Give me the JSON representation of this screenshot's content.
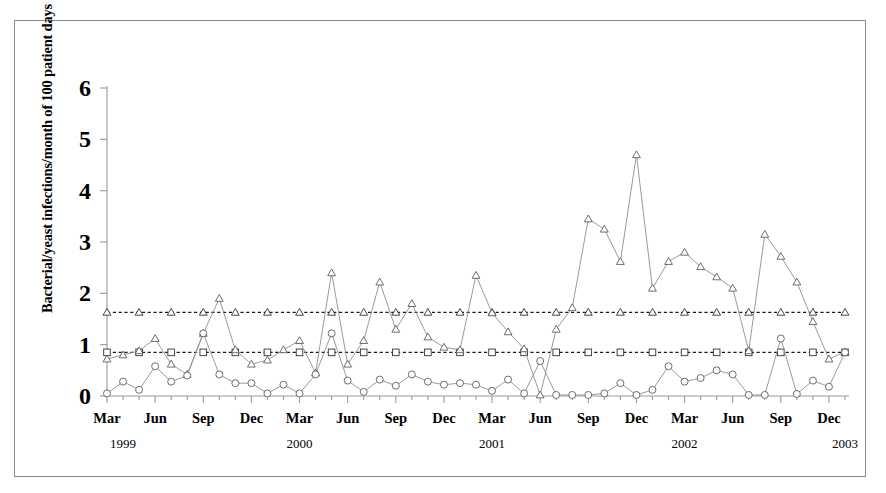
{
  "figure": {
    "ylabel": "Bacterial/yeast infections/month of 100 patient days",
    "y_ticks": [
      "0",
      "1",
      "2",
      "3",
      "4",
      "5",
      "6"
    ],
    "x_month_labels": [
      "Mar",
      "Jun",
      "Sep",
      "Dec",
      "Mar",
      "Jun",
      "Sep",
      "Dec",
      "Mar",
      "Jun",
      "Sep",
      "Dec",
      "Mar",
      "Jun",
      "Sep",
      "Dec"
    ],
    "x_year_labels": [
      "1999",
      "2000",
      "2001",
      "2002",
      "2003"
    ]
  },
  "chart_data": {
    "type": "line",
    "title": "",
    "xlabel": "",
    "ylabel": "Bacterial/yeast infections/month of 100 patient days",
    "ylim": [
      0,
      6
    ],
    "yticks": [
      0,
      1,
      2,
      3,
      4,
      5,
      6
    ],
    "grid": false,
    "legend": "none",
    "x": [
      "Mar 1999",
      "Apr 1999",
      "May 1999",
      "Jun 1999",
      "Jul 1999",
      "Aug 1999",
      "Sep 1999",
      "Oct 1999",
      "Nov 1999",
      "Dec 1999",
      "Jan 2000",
      "Feb 2000",
      "Mar 2000",
      "Apr 2000",
      "May 2000",
      "Jun 2000",
      "Jul 2000",
      "Aug 2000",
      "Sep 2000",
      "Oct 2000",
      "Nov 2000",
      "Dec 2000",
      "Jan 2001",
      "Feb 2001",
      "Mar 2001",
      "Apr 2001",
      "May 2001",
      "Jun 2001",
      "Jul 2001",
      "Aug 2001",
      "Sep 2001",
      "Oct 2001",
      "Nov 2001",
      "Dec 2001",
      "Jan 2002",
      "Feb 2002",
      "Mar 2002",
      "Apr 2002",
      "May 2002",
      "Jun 2002",
      "Jul 2002",
      "Aug 2002",
      "Sep 2002",
      "Oct 2002",
      "Nov 2002",
      "Dec 2002",
      "Jan 2003"
    ],
    "x_tick_months": [
      "Mar",
      "Jun",
      "Sep",
      "Dec",
      "Mar",
      "Jun",
      "Sep",
      "Dec",
      "Mar",
      "Jun",
      "Sep",
      "Dec",
      "Mar",
      "Jun",
      "Sep",
      "Dec"
    ],
    "x_tick_indices": [
      0,
      3,
      6,
      9,
      12,
      15,
      18,
      21,
      24,
      27,
      30,
      33,
      36,
      39,
      42,
      45
    ],
    "x_year_marks": [
      {
        "label": "1999",
        "index": 1
      },
      {
        "label": "2000",
        "index": 12
      },
      {
        "label": "2001",
        "index": 24
      },
      {
        "label": "2002",
        "index": 36
      },
      {
        "label": "2003",
        "index": 46
      }
    ],
    "series": [
      {
        "name": "triangle-series",
        "marker": "triangle",
        "values": [
          0.72,
          0.8,
          0.88,
          1.12,
          0.62,
          0.42,
          1.22,
          1.9,
          0.9,
          0.62,
          0.7,
          0.9,
          1.08,
          0.45,
          2.4,
          0.62,
          1.08,
          2.22,
          1.3,
          1.8,
          1.15,
          0.95,
          0.9,
          2.35,
          1.62,
          1.25,
          0.92,
          0.02,
          1.3,
          1.72,
          3.45,
          3.25,
          2.62,
          4.7,
          2.1,
          2.62,
          2.8,
          2.52,
          2.32,
          2.1,
          0.88,
          3.15,
          2.72,
          2.22,
          1.45,
          0.72,
          0.86
        ]
      },
      {
        "name": "circle-series",
        "marker": "circle",
        "values": [
          0.05,
          0.28,
          0.12,
          0.58,
          0.28,
          0.4,
          1.22,
          0.42,
          0.25,
          0.25,
          0.05,
          0.22,
          0.05,
          0.42,
          1.22,
          0.3,
          0.08,
          0.32,
          0.2,
          0.42,
          0.28,
          0.22,
          0.25,
          0.22,
          0.1,
          0.32,
          0.05,
          0.68,
          0.02,
          0.02,
          0.02,
          0.05,
          0.25,
          0.02,
          0.12,
          0.58,
          0.28,
          0.35,
          0.5,
          0.42,
          0.02,
          0.02,
          1.12,
          0.04,
          0.3,
          0.18,
          0.85
        ]
      }
    ],
    "reference_lines": [
      {
        "name": "triangle-reference-line",
        "marker": "triangle",
        "value": 1.63
      },
      {
        "name": "square-reference-line",
        "marker": "square",
        "value": 0.85
      }
    ]
  }
}
